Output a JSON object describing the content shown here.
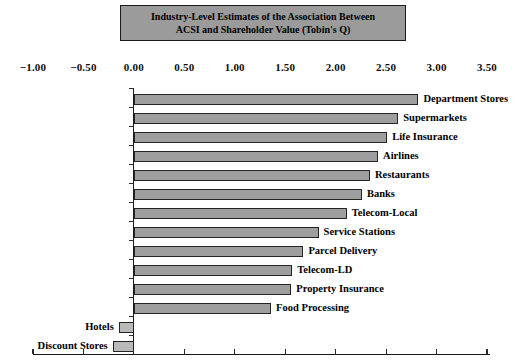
{
  "title": {
    "line1": "Industry-Level Estimates of the Association Between",
    "line2": "ACSI and Shareholder Value (Tobin's Q)"
  },
  "colors": {
    "background": "#ffffff",
    "title_box_fill": "#9b9b9b",
    "title_box_border": "#1a1a1a",
    "bar_fill_positive": "#9e9e9e",
    "bar_fill_negative": "#b9b9b9",
    "bar_border": "#242424",
    "axis": "#1a1a1a",
    "text": "#000000"
  },
  "chart_data": {
    "type": "bar",
    "orientation": "horizontal",
    "title": "Industry-Level Estimates of the Association Between ACSI and Shareholder Value (Tobin's Q)",
    "xlabel": "",
    "ylabel": "",
    "xlim": [
      -1.0,
      3.6
    ],
    "grid": false,
    "legend": false,
    "axis_labels_position": "top",
    "x_ticks": [
      "−1.00",
      "−0.50",
      "0.00",
      "0.50",
      "1.00",
      "1.50",
      "2.00",
      "2.50",
      "3.00",
      "3.50"
    ],
    "x_tick_values": [
      -1.0,
      -0.5,
      0.0,
      0.5,
      1.0,
      1.5,
      2.0,
      2.5,
      3.0,
      3.5
    ],
    "categories": [
      "Department Stores",
      "Supermarkets",
      "Life Insurance",
      "Airlines",
      "Restaurants",
      "Banks",
      "Telecom-Local",
      "Service Stations",
      "Parcel Delivery",
      "Telecom-LD",
      "Property Insurance",
      "Food Processing",
      "Hotels",
      "Discount Stores"
    ],
    "values": [
      2.82,
      2.62,
      2.51,
      2.42,
      2.34,
      2.26,
      2.11,
      1.83,
      1.68,
      1.57,
      1.56,
      1.36,
      -0.15,
      -0.21
    ]
  }
}
